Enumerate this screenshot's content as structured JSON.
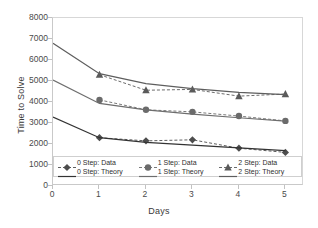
{
  "chart_data": {
    "type": "line",
    "title": "",
    "xlabel": "Days",
    "ylabel": "Time to Solve",
    "xlim": [
      0,
      5.4
    ],
    "ylim": [
      0,
      8000
    ],
    "xticks": [
      "0",
      "1",
      "2",
      "3",
      "4",
      "5"
    ],
    "yticks": [
      "0",
      "1000",
      "2000",
      "3000",
      "4000",
      "5000",
      "6000",
      "7000",
      "8000"
    ],
    "grid": false,
    "legend_position": "inside-bottom",
    "series": [
      {
        "name": "0 Step: Data",
        "style": "dashed",
        "marker": "diamond",
        "color": "#4d4d4d",
        "x": [
          1,
          2,
          3,
          4,
          5
        ],
        "values": [
          2300,
          2150,
          2200,
          1800,
          1600
        ]
      },
      {
        "name": "1 Step: Data",
        "style": "dashed",
        "marker": "circle",
        "color": "#6b6b6b",
        "x": [
          1,
          2,
          3,
          4,
          5
        ],
        "values": [
          4100,
          3630,
          3530,
          3330,
          3100
        ]
      },
      {
        "name": "2 Step: Data",
        "style": "dashed",
        "marker": "triangle",
        "color": "#5a5a5a",
        "x": [
          1,
          2,
          3,
          4,
          5
        ],
        "values": [
          5300,
          4560,
          4600,
          4280,
          4380
        ]
      },
      {
        "name": "0 Step: Theory",
        "style": "solid",
        "marker": "none",
        "color": "#333333",
        "x": [
          0,
          1,
          2,
          3,
          4,
          5
        ],
        "values": [
          3280,
          2300,
          2080,
          1950,
          1820,
          1690
        ]
      },
      {
        "name": "1 Step: Theory",
        "style": "solid",
        "marker": "none",
        "color": "#6e6e6e",
        "x": [
          0,
          1,
          2,
          3,
          4,
          5
        ],
        "values": [
          5050,
          3930,
          3620,
          3420,
          3250,
          3090
        ]
      },
      {
        "name": "2 Step: Theory",
        "style": "solid",
        "marker": "none",
        "color": "#5e5e5e",
        "x": [
          0,
          1,
          2,
          3,
          4,
          5
        ],
        "values": [
          6800,
          5350,
          4880,
          4640,
          4460,
          4350
        ]
      }
    ]
  },
  "legend": {
    "row1": [
      "0 Step: Data",
      "1 Step: Data",
      "2 Step: Data"
    ],
    "row2": [
      "0 Step: Theory",
      "1 Step: Theory",
      "2 Step: Theory"
    ]
  }
}
